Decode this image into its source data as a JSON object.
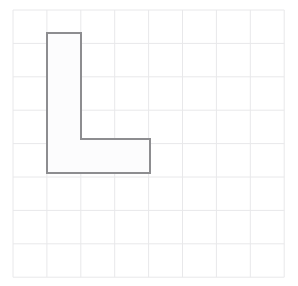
{
  "figure": {
    "background_color": "#ffffff",
    "grid": {
      "name": "square-grid",
      "columns": 8,
      "rows": 8,
      "x_start": 13,
      "y_start": 10,
      "cell_width": 33.9,
      "cell_height": 33.4,
      "line_color": "#e8e8ea",
      "line_width": 1,
      "visible": true
    },
    "shape": {
      "name": "L-shape",
      "type": "polygon",
      "fill_color": "#fcfcfd",
      "stroke_color": "#8d8d90",
      "stroke_width": 2,
      "cells_occupied": 6,
      "vertical_bar_cells": "1 wide x 4 tall",
      "horizontal_foot_cells": "3 wide x 1 tall",
      "grid_vertices": [
        [
          1,
          1
        ],
        [
          2,
          1
        ],
        [
          2,
          4
        ],
        [
          4,
          4
        ],
        [
          4,
          5
        ],
        [
          1,
          5
        ]
      ],
      "pixel_vertices": [
        [
          47,
          33
        ],
        [
          81,
          33
        ],
        [
          81,
          139
        ],
        [
          150,
          139
        ],
        [
          150,
          173
        ],
        [
          47,
          173
        ]
      ]
    }
  },
  "chart_data": {
    "type": "scatter",
    "xlabel": "",
    "ylabel": "",
    "xlim": [
      0,
      8
    ],
    "ylim": [
      0,
      8
    ],
    "grid": true,
    "legend": "none",
    "annotations": [],
    "series": [
      {
        "name": "L-shape outline",
        "closed": true,
        "x": [
          1,
          2,
          2,
          4,
          4,
          1
        ],
        "y": [
          1,
          1,
          4,
          4,
          5,
          5
        ]
      }
    ]
  }
}
